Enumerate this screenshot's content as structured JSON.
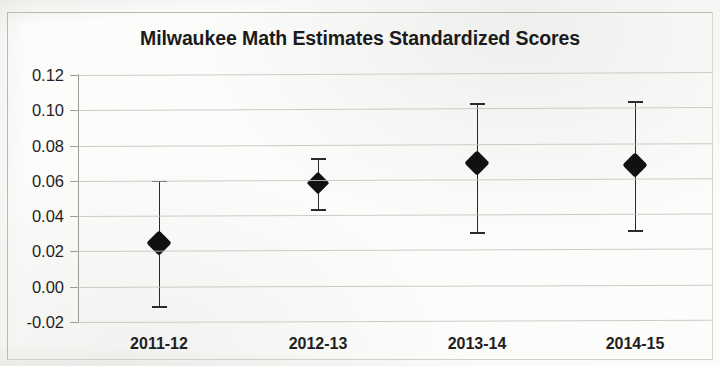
{
  "figure": {
    "title": "Milwaukee Math Estimates Standardized Scores"
  },
  "chart_data": {
    "type": "scatter",
    "title": "Milwaukee Math Estimates Standardized Scores",
    "subtitle": "",
    "xlabel": "",
    "ylabel": "",
    "categories": [
      "2011-12",
      "2012-13",
      "2013-14",
      "2014-15"
    ],
    "values": [
      0.025,
      0.059,
      0.07,
      0.069
    ],
    "error_low": [
      -0.011,
      0.044,
      0.031,
      0.032
    ],
    "error_high": [
      0.06,
      0.073,
      0.104,
      0.105
    ],
    "series": [
      {
        "name": "Milwaukee Math Estimate",
        "values": [
          0.025,
          0.059,
          0.07,
          0.069
        ],
        "ci_lower": [
          -0.011,
          0.044,
          0.031,
          0.032
        ],
        "ci_upper": [
          0.06,
          0.073,
          0.104,
          0.105
        ]
      }
    ],
    "points": [
      {
        "category": "2011-12",
        "estimate": 0.025,
        "ci_lower": -0.011,
        "ci_upper": 0.06
      },
      {
        "category": "2012-13",
        "estimate": 0.059,
        "ci_lower": 0.044,
        "ci_upper": 0.073
      },
      {
        "category": "2013-14",
        "estimate": 0.07,
        "ci_lower": 0.031,
        "ci_upper": 0.104
      },
      {
        "category": "2014-15",
        "estimate": 0.069,
        "ci_lower": 0.032,
        "ci_upper": 0.105
      }
    ],
    "ylim": [
      -0.02,
      0.12
    ],
    "ytick_labels": [
      "0.12",
      "0.10",
      "0.08",
      "0.06",
      "0.04",
      "0.02",
      "0.00",
      "-0.02"
    ],
    "ytick_values": [
      0.12,
      0.1,
      0.08,
      0.06,
      0.04,
      0.02,
      0.0,
      -0.02
    ],
    "xtick_labels": [
      "2011-12",
      "2012-13",
      "2013-14",
      "2014-15"
    ],
    "grid": true,
    "grid_axis": "y",
    "legend": false,
    "legend_position": "none",
    "marker": "diamond",
    "marker_color": "#111111",
    "errorbar_color": "#2a2a2a",
    "gridline_color": "#c3c3bf",
    "background_color": "#fcfcfb"
  }
}
